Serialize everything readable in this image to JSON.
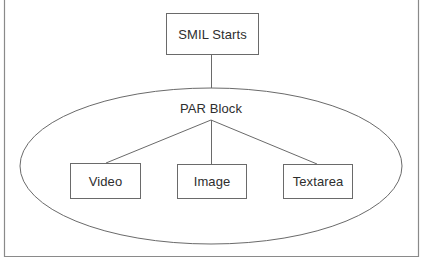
{
  "diagram": {
    "type": "hierarchy",
    "root": {
      "label": "SMIL Starts"
    },
    "container": {
      "label": "PAR Block",
      "shape": "ellipse"
    },
    "children": [
      {
        "label": "Video"
      },
      {
        "label": "Image"
      },
      {
        "label": "Textarea"
      }
    ],
    "edges": [
      {
        "from": "SMIL Starts",
        "to": "PAR Block"
      },
      {
        "from": "PAR Block",
        "to": "Video"
      },
      {
        "from": "PAR Block",
        "to": "Image"
      },
      {
        "from": "PAR Block",
        "to": "Textarea"
      }
    ],
    "colors": {
      "stroke": "#6a6a6a",
      "text": "#2e2e2e",
      "frame": "#8a8a8a",
      "background": "#ffffff"
    }
  }
}
